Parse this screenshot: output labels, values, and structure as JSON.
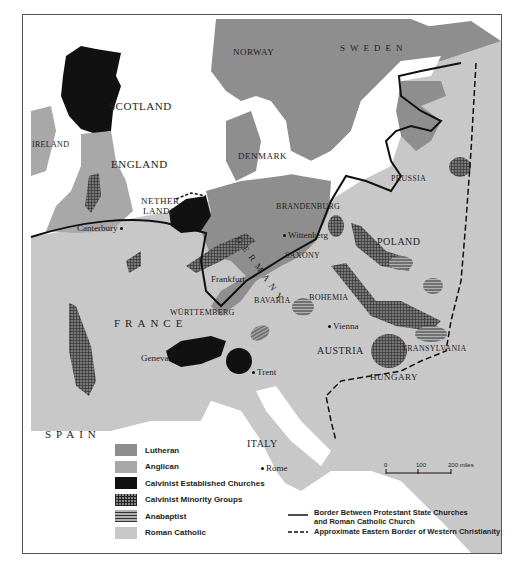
{
  "map": {
    "countries": {
      "scotland": "SCOTLAND",
      "ireland": "IRELAND",
      "england": "ENGLAND",
      "netherlands_1": "NETHER",
      "netherlands_2": "LANDS",
      "norway": "NORWAY",
      "sweden": "SWEDEN",
      "denmark": "DENMARK",
      "germany": "GERMANY",
      "poland": "POLAND",
      "france": "FRANCE",
      "austria": "AUSTRIA",
      "hungary": "HUNGARY",
      "spain": "SPAIN",
      "italy": "ITALY"
    },
    "regions": {
      "brandenburg": "BRANDENBURG",
      "prussia": "PRUSSIA",
      "saxony": "SAXONY",
      "bavaria": "BAVARIA",
      "bohemia": "BOHEMIA",
      "wurttemberg": "WÜRTTEMBERG",
      "transylvania": "TRANSYLVANIA"
    },
    "cities": {
      "canterbury": "Canterbury",
      "wittenberg": "Wittenberg",
      "frankfurt": "Frankfurt",
      "vienna": "Vienna",
      "geneva": "Geneva",
      "trent": "Trent",
      "rome": "Rome"
    }
  },
  "legend": {
    "items": [
      {
        "label": "Lutheran",
        "color": "#8e8e8e",
        "pattern": "solid"
      },
      {
        "label": "Anglican",
        "color": "#a8a8a8",
        "pattern": "solid"
      },
      {
        "label": "Calvinist Established Churches",
        "color": "#111111",
        "pattern": "solid"
      },
      {
        "label": "Calvinist Minority Groups",
        "color": "#555555",
        "pattern": "crosshatch"
      },
      {
        "label": "Anabaptist",
        "color": "#666666",
        "pattern": "horizontal-lines"
      },
      {
        "label": "Roman Catholic",
        "color": "#c8c8c8",
        "pattern": "solid"
      }
    ],
    "lines": [
      {
        "label_1": "Border Between Protestant State Churches",
        "label_2": "and Roman Catholic Church",
        "style": "solid"
      },
      {
        "label_1": "Approximate Eastern Border of Western Christianity",
        "style": "dashed"
      }
    ]
  },
  "scale": {
    "ticks": [
      "0",
      "100",
      "200 miles"
    ]
  },
  "colors": {
    "sea": "#ffffff",
    "lutheran": "#8e8e8e",
    "anglican": "#a8a8a8",
    "calvinist": "#111111",
    "catholic": "#c8c8c8",
    "border": "#111111"
  }
}
